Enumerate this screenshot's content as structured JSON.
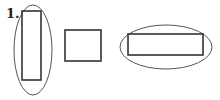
{
  "figure": {
    "label": "1.",
    "stroke_color": "#333333",
    "ellipse_color": "#555555",
    "shapes": [
      {
        "type": "ellipse-enclosing-rectangle",
        "description": "tall rectangle circled"
      },
      {
        "type": "square",
        "description": "square not circled"
      },
      {
        "type": "ellipse-enclosing-rectangle",
        "description": "wide rectangle circled"
      }
    ]
  }
}
